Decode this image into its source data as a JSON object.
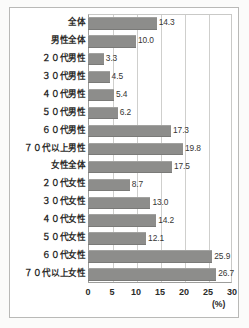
{
  "chart_data": {
    "type": "bar",
    "orientation": "horizontal",
    "title": "",
    "xlabel": "(%)",
    "ylabel": "",
    "xlim": [
      0,
      30
    ],
    "xticks": [
      "0",
      "5",
      "10",
      "15",
      "20",
      "25",
      "30"
    ],
    "grid": true,
    "legend": "none",
    "bar_color": "#8d8d8b",
    "categories": [
      "全体",
      "男性全体",
      "２０代男性",
      "３０代男性",
      "４０代男性",
      "５０代男性",
      "６０代男性",
      "７０代以上男性",
      "女性全体",
      "２０代女性",
      "３０代女性",
      "４０代女性",
      "５０代女性",
      "６０代女性",
      "７０代以上女性"
    ],
    "values": [
      14.3,
      10.0,
      3.3,
      4.5,
      5.4,
      6.2,
      17.3,
      19.8,
      17.5,
      8.7,
      13.0,
      14.2,
      12.1,
      25.9,
      26.7
    ],
    "value_labels": [
      "14.3",
      "10.0",
      "3.3",
      "4.5",
      "5.4",
      "6.2",
      "17.3",
      "19.8",
      "17.5",
      "8.7",
      "13.0",
      "14.2",
      "12.1",
      "25.9",
      "26.7"
    ]
  }
}
